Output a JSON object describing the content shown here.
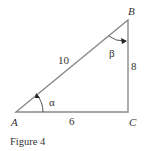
{
  "figure": {
    "caption": "Figure 4",
    "vertices": {
      "A": "A",
      "B": "B",
      "C": "C"
    },
    "sides": {
      "hypotenuse_AB": "10",
      "side_BC": "8",
      "side_AC": "6"
    },
    "angles": {
      "at_A": "α",
      "at_B": "β"
    },
    "right_angle_at": "C",
    "colors": {
      "line": "#8a8a8a",
      "text": "#333333",
      "arrow": "#222222"
    }
  }
}
